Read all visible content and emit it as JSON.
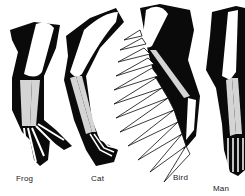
{
  "diagram": {
    "colors": {
      "flesh": "#0a0a0a",
      "humerus": "#ffffff",
      "forearm_bones": "#d4d4d4",
      "background": "#ffffff",
      "feathers": "#ffffff"
    },
    "limbs": [
      {
        "id": "frog",
        "label": "Frog"
      },
      {
        "id": "cat",
        "label": "Cat"
      },
      {
        "id": "bird",
        "label": "Bird"
      },
      {
        "id": "man",
        "label": "Man"
      }
    ]
  }
}
